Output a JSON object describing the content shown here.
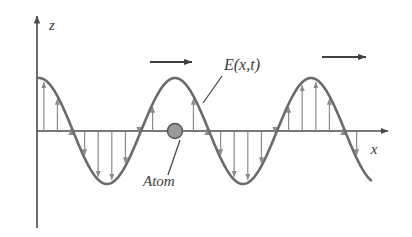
{
  "figure": {
    "background_color": "#ffffff",
    "width": 412,
    "height": 237
  },
  "axes": {
    "vertical": {
      "label": "z",
      "label_x": 52,
      "label_y": 30,
      "x": 37,
      "y_top": 14,
      "y_bottom": 228,
      "color": "#4a4a4a"
    },
    "horizontal": {
      "label": "x",
      "label_x": 374,
      "label_y": 154,
      "y": 131,
      "x_left": 37,
      "x_right": 390,
      "color": "#4a4a4a"
    }
  },
  "labels": {
    "field": {
      "text": "E(x,t)",
      "x": 224,
      "y": 70,
      "leader": {
        "x1": 222,
        "y1": 76,
        "x2": 203,
        "y2": 103
      }
    },
    "atom": {
      "text": "Atom",
      "x": 143,
      "y": 186,
      "leader": {
        "x1": 168,
        "y1": 175,
        "x2": 180,
        "y2": 140
      }
    }
  },
  "atom_marker": {
    "name": "Atom",
    "x": 175,
    "y": 131,
    "radius": 7.5,
    "fill_color": "#9a9a9a",
    "stroke_color": "#555555"
  },
  "propagation_arrows": [
    {
      "x1": 150,
      "y1": 62,
      "x2": 192,
      "y2": 62
    },
    {
      "x1": 322,
      "y1": 57,
      "x2": 366,
      "y2": 57
    }
  ],
  "colors": {
    "curve": "#6b6b6b",
    "field_arrow": "#8c8c8c",
    "axis": "#4a4a4a",
    "text": "#3a3a3a",
    "atom_fill": "#9a9a9a",
    "atom_stroke": "#555555"
  },
  "chart_data": {
    "type": "line",
    "title": "",
    "xlabel": "x",
    "ylabel": "z",
    "grid": false,
    "legend": null,
    "annotations": [
      {
        "text": "E(x,t)",
        "target": "wave curve"
      },
      {
        "text": "Atom",
        "target": "particle at zero crossing on x-axis"
      },
      {
        "text": "propagation direction arrow",
        "target": "first crest"
      },
      {
        "text": "propagation direction arrow",
        "target": "third crest"
      }
    ],
    "wave": {
      "description": "Transverse electric field E(x,t) plotted as a sinusoid along x with field vectors drawn from the x-axis to the curve",
      "amplitude_px": 53,
      "wavelength_px": 136,
      "phase_description": "starts on the z-axis at a positive value and descends",
      "x_start_px": 37,
      "x_end_px": 371,
      "baseline_y_px": 131,
      "atom_position_px": 175,
      "crests_px": [
        175,
        311
      ],
      "troughs_px": [
        107,
        243
      ]
    },
    "field_vectors": {
      "description": "vertical arrows from the x-axis to the wave curve; upward where E>0, downward where E<0",
      "spacing_px": 13.6,
      "color": "#8c8c8c"
    }
  }
}
